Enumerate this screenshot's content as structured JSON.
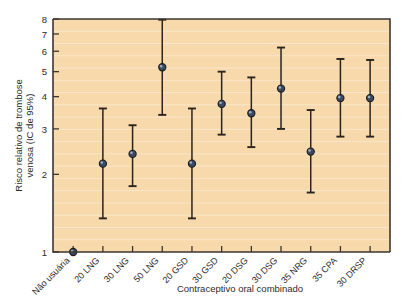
{
  "chart_data": {
    "type": "scatter",
    "title": "",
    "xlabel": "Contraceptivo oral combinado",
    "ylabel": "Risco relativo de trombose venosa (IC de 95%)",
    "yscale": "log",
    "ylim": [
      1,
      8
    ],
    "yticks": [
      1,
      2,
      3,
      4,
      5,
      6,
      7,
      8
    ],
    "ytick_labels": [
      "1",
      "2",
      "3",
      "4",
      "5",
      "6",
      "7",
      "8"
    ],
    "grid": true,
    "legend": "none",
    "categories": [
      "Não usuária",
      "20 LNG",
      "30 LNG",
      "50 LNG",
      "20 GSD",
      "30 GSD",
      "20 DSG",
      "30 DSG",
      "35 NRG",
      "35 CPA",
      "30 DRSP"
    ],
    "series": [
      {
        "name": "Risco relativo (IC de 95%)",
        "values": [
          1.0,
          2.2,
          2.4,
          5.2,
          2.2,
          3.75,
          3.45,
          4.3,
          2.45,
          3.95,
          3.95
        ],
        "ci_low": [
          1.0,
          1.35,
          1.8,
          3.4,
          1.35,
          2.85,
          2.55,
          3.0,
          1.7,
          2.8,
          2.8
        ],
        "ci_high": [
          1.0,
          3.6,
          3.1,
          7.95,
          3.6,
          5.0,
          4.75,
          6.2,
          3.55,
          5.6,
          5.55
        ]
      }
    ]
  },
  "colors": {
    "plot_background": "#f7d9ab",
    "gridline": "#fbead2",
    "axis": "#3d3630",
    "marker_fill": "#3b4a63",
    "marker_highlight": "#9fb0c6",
    "error_bar": "#2a241e",
    "text": "#2b2b2b",
    "page_background": "#ffffff"
  }
}
